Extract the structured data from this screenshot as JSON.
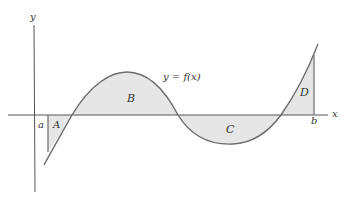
{
  "diagram": {
    "axis_labels": {
      "x": "x",
      "y": "y"
    },
    "bound_labels": {
      "a": "a",
      "b": "b"
    },
    "curve_label": "y = f(x)",
    "region_labels": {
      "A": "A",
      "B": "B",
      "C": "C",
      "D": "D"
    },
    "colors": {
      "fill": "#e6e6e6",
      "stroke": "#6b6b6b",
      "axis": "#555555"
    }
  }
}
